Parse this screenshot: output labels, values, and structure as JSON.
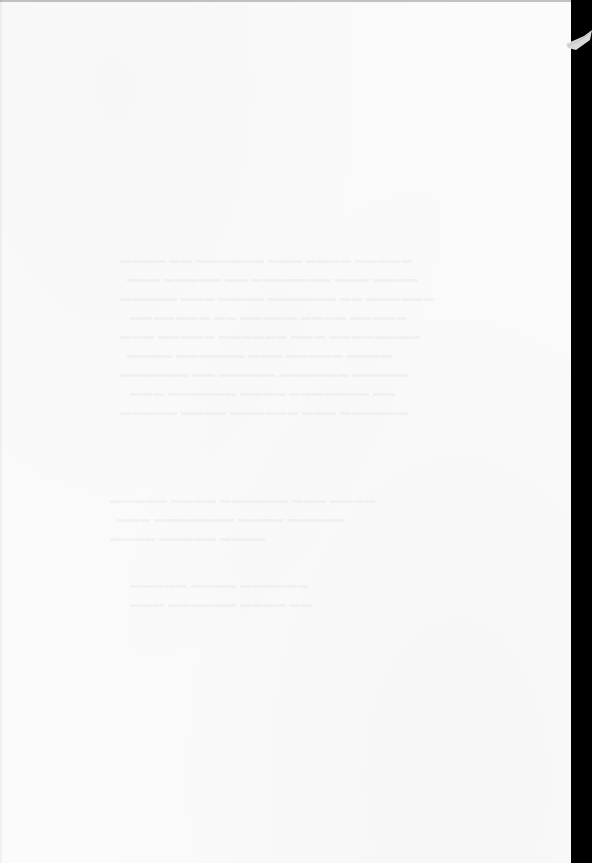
{
  "document": {
    "type": "scanned blank page",
    "visible_text": "",
    "note": "Page is blank; only faint illegible show-through from reverse side is present."
  },
  "colors": {
    "paper": "#fbfbfb",
    "scanner_background": "#000000"
  }
}
